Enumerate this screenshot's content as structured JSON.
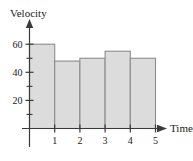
{
  "chart_data": {
    "type": "bar",
    "title": "",
    "xlabel": "Time",
    "ylabel": "Velocity",
    "categories": [
      "1",
      "2",
      "3",
      "4",
      "5"
    ],
    "values": [
      60,
      48,
      50,
      55,
      50
    ],
    "series": [
      {
        "name": "Velocity",
        "values": [
          60,
          48,
          50,
          55,
          50
        ]
      }
    ],
    "x_tick_labels": [
      "1",
      "2",
      "3",
      "4",
      "5"
    ],
    "y_tick_labels": [
      "20",
      "40",
      "60"
    ],
    "y_major_ticks": [
      20,
      40,
      60
    ],
    "y_minor_ticks": [
      10,
      30,
      50
    ],
    "xlim": [
      0,
      5
    ],
    "ylim": [
      0,
      65
    ],
    "grid": false,
    "legend": null,
    "bar_fill_color": "#dcdcdc",
    "bar_stroke_color": "#8c8c8c",
    "axis_color": "#3a3a3a",
    "x_axis_arrow": true,
    "y_axis_arrow": true,
    "bars_contiguous": true,
    "annotations": []
  },
  "labels": {
    "y_axis_title": "Velocity",
    "x_axis_title": "Time"
  }
}
